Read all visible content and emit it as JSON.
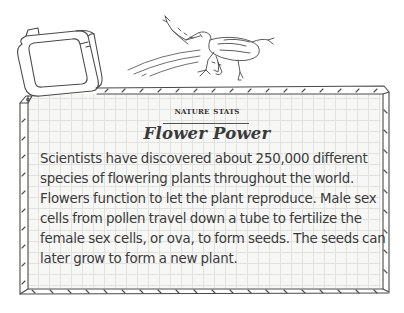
{
  "illustration": {
    "elements": [
      "tape-measure",
      "frog",
      "grid-panel"
    ],
    "colors": {
      "ink": "#4a4a4a",
      "grid": "#e2e2e0",
      "panel": "#f7f7f6",
      "text": "#3b3b3b"
    }
  },
  "card": {
    "kicker": "Nature Stats",
    "title": "Flower Power",
    "body_lines": [
      "Scientists have discovered about 250,000 different",
      "species of flowering plants throughout the world.",
      "Flowers function to let the plant reproduce. Male sex",
      "cells from pollen travel down a tube to fertilize the",
      "female sex cells, or ova, to form seeds. The seeds can",
      "later grow to form a new plant."
    ]
  }
}
